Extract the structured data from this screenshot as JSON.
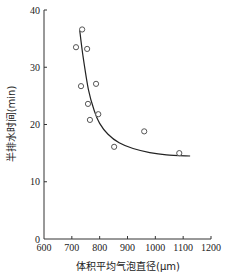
{
  "chart_data": {
    "type": "scatter",
    "title": "",
    "xlabel": "体积平均气泡直径(μm)",
    "ylabel": "半排水时间(min)",
    "xlim": [
      600,
      1200
    ],
    "ylim": [
      0,
      40
    ],
    "x_ticks": [
      600,
      700,
      800,
      900,
      1000,
      1100,
      1200
    ],
    "y_ticks": [
      0,
      10,
      20,
      30,
      40
    ],
    "grid": false,
    "legend": null,
    "series": [
      {
        "name": "measured",
        "kind": "scatter",
        "marker": "open-circle",
        "points": [
          {
            "x": 737,
            "y": 36.6
          },
          {
            "x": 715,
            "y": 33.5
          },
          {
            "x": 755,
            "y": 33.2
          },
          {
            "x": 733,
            "y": 26.7
          },
          {
            "x": 787,
            "y": 27.1
          },
          {
            "x": 758,
            "y": 23.6
          },
          {
            "x": 795,
            "y": 21.8
          },
          {
            "x": 765,
            "y": 20.8
          },
          {
            "x": 852,
            "y": 16.1
          },
          {
            "x": 960,
            "y": 18.8
          },
          {
            "x": 1086,
            "y": 15.0
          }
        ]
      },
      {
        "name": "fit",
        "kind": "line",
        "points": [
          {
            "x": 728,
            "y": 36.6
          },
          {
            "x": 740,
            "y": 32.0
          },
          {
            "x": 760,
            "y": 26.0
          },
          {
            "x": 780,
            "y": 22.5
          },
          {
            "x": 800,
            "y": 20.2
          },
          {
            "x": 830,
            "y": 18.3
          },
          {
            "x": 870,
            "y": 16.8
          },
          {
            "x": 920,
            "y": 15.8
          },
          {
            "x": 980,
            "y": 15.1
          },
          {
            "x": 1040,
            "y": 14.7
          },
          {
            "x": 1125,
            "y": 14.5
          }
        ]
      }
    ]
  },
  "colors": {
    "axis": "#333333",
    "marker_stroke": "#555555",
    "curve": "#222222"
  }
}
